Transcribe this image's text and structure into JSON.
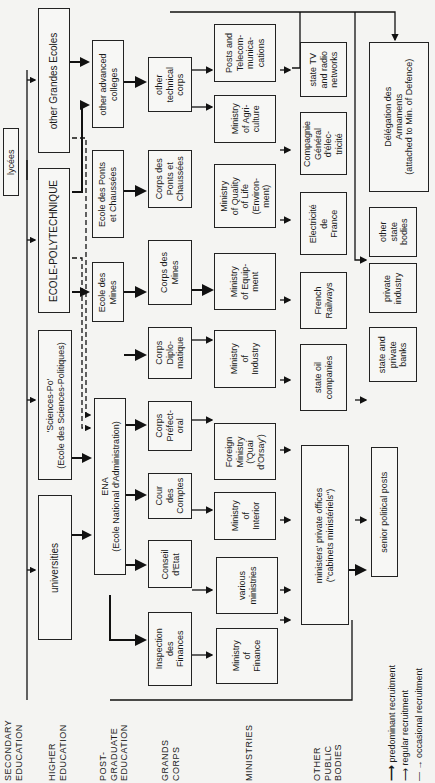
{
  "row_labels": {
    "secondary": "SECONDARY\nEDUCATION",
    "higher": "HIGHER\nEDUCATION",
    "postgrad": "POST-\nGRADUATE\nEDUCATION",
    "grands_corps": "GRANDS\nCORPS",
    "ministries": "MINISTRIES",
    "other_public": "OTHER\nPUBLIC\nBODIES"
  },
  "nodes": {
    "lycees": "lycées",
    "other_grandes_ecoles": "other Grandes Ecoles",
    "polytechnique": "ECOLE-POLYTECHNIQUE",
    "sciences_po": "'Sciences-Po'\n(Ecole des Sciences-Politiques)",
    "universities": "universities",
    "other_advanced_colleges": "other advanced\ncolleges",
    "ecole_ponts": "Ecole des Ponts\net Chaussées",
    "ecole_mines": "Ecole des\nMines",
    "ena": "ENA\n(Ecole National d'Administration)",
    "other_technical_corps": "other\ntechnical\ncorps",
    "corps_ponts": "Corps des\nPonts et\nChaussées",
    "corps_mines": "Corps des\nMines",
    "corps_diplomatique": "Corps\nDiplo-\nmatique",
    "corps_prefectoral": "Corps\nPréfect-\noral",
    "cour_comptes": "Cour\ndes\nComptes",
    "conseil_etat": "Conseil\nd'Etat",
    "inspection_finances": "Inspection\ndes\nFinances",
    "posts_telecom": "Posts and\nTelecom-\nmunica-\ncations",
    "min_agriculture": "Ministry\nof Agri-\nculture",
    "min_quality_life": "Ministry\nof Quality\nof Life\n(Environ-\nment)",
    "min_equipment": "Ministry\nof Equip-\nment",
    "min_industry": "Ministry\nof\nIndustry",
    "foreign_ministry": "Foreign\nMinistry\n('Quai\nd'Orsay')",
    "min_interior": "Ministry\nof\nInterior",
    "various_ministries": "various\nministries",
    "min_finance": "Ministry\nof\nFinance",
    "state_tv": "state TV\nand radio\nnetworks",
    "compagnie_generale": "Compagnie\nGénéral\nd'élec-\ntricité",
    "edf": "Electricité\nde\nFrance",
    "french_railways": "French\nRailways",
    "state_oil": "state oil\ncompanies",
    "cabinets": "ministers' private offices\n(\"cabinets ministériels\")",
    "delegation_armements": "Délégation des\nArmaments\n(attached to Min. of Defence)",
    "other_state_bodies": "other\nstate\nbodies",
    "private_industry": "private\nindustry",
    "banks": "state and\nprivate\nbanks",
    "senior_political": "senior political posts"
  },
  "legend": {
    "predominant": "predominant recruitment",
    "regular": "regular recruitment",
    "occasional": "occasional recruitment"
  }
}
